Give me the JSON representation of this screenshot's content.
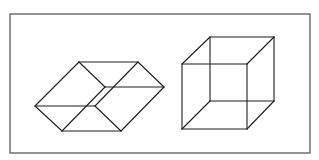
{
  "figure": {
    "width": 319,
    "height": 160,
    "background": "#ffffff",
    "frame": {
      "x": 10,
      "y": 14,
      "width": 300,
      "height": 139,
      "color": "#5a5a5a"
    },
    "line_color": "#1e1e1e",
    "shapes": [
      {
        "name": "rhombic-hexagon-figure",
        "description": "Hexagon outline subdivided into three rhombi (flat isometric tiling)",
        "segments": [
          [
            35,
            106,
            79,
            62
          ],
          [
            79,
            62,
            138,
            62
          ],
          [
            138,
            62,
            164,
            87
          ],
          [
            164,
            87,
            121,
            131
          ],
          [
            121,
            131,
            62,
            131
          ],
          [
            62,
            131,
            35,
            106
          ],
          [
            79,
            62,
            105,
            87
          ],
          [
            105,
            87,
            164,
            87
          ],
          [
            105,
            87,
            62,
            131
          ],
          [
            138,
            62,
            95,
            106
          ],
          [
            35,
            106,
            95,
            106
          ],
          [
            95,
            106,
            121,
            131
          ]
        ]
      },
      {
        "name": "wireframe-cube",
        "description": "Necker cube wireframe",
        "front_square": {
          "x1": 182,
          "y1": 64,
          "x2": 247,
          "y2": 129
        },
        "back_square": {
          "x1": 210,
          "y1": 37,
          "x2": 274,
          "y2": 101
        },
        "segments": [
          [
            182,
            64,
            247,
            64
          ],
          [
            247,
            64,
            247,
            129
          ],
          [
            247,
            129,
            182,
            129
          ],
          [
            182,
            129,
            182,
            64
          ],
          [
            210,
            37,
            274,
            37
          ],
          [
            274,
            37,
            274,
            101
          ],
          [
            274,
            101,
            210,
            101
          ],
          [
            210,
            101,
            210,
            37
          ],
          [
            182,
            64,
            210,
            37
          ],
          [
            247,
            64,
            274,
            37
          ],
          [
            247,
            129,
            274,
            101
          ],
          [
            182,
            129,
            210,
            101
          ]
        ]
      }
    ]
  }
}
